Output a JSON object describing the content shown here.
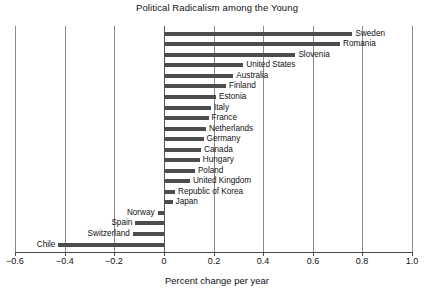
{
  "chart_data": {
    "type": "bar",
    "orientation": "horizontal",
    "title": "Political Radicalism among the Young",
    "xlabel": "Percent change per year",
    "ylabel": "",
    "xlim": [
      -0.6,
      1.0
    ],
    "xticks": [
      -0.6,
      -0.4,
      -0.2,
      0,
      0.2,
      0.4,
      0.6,
      0.8,
      1.0
    ],
    "xticklabels": [
      "−0.6",
      "−0.4",
      "−0.2",
      "0",
      "0.2",
      "0.4",
      "0.6",
      "0.8",
      "1.0"
    ],
    "grid": true,
    "grid_axis": "x",
    "legend": false,
    "bar_color": "#4d4d4d",
    "categories": [
      "Sweden",
      "Romania",
      "Slovenia",
      "United States",
      "Australia",
      "Finland",
      "Estonia",
      "Italy",
      "France",
      "Netherlands",
      "Germany",
      "Canada",
      "Hungary",
      "Poland",
      "United Kingdom",
      "Republic of Korea",
      "Japan",
      "Norway",
      "Spain",
      "Switzerland",
      "Chile"
    ],
    "values": [
      0.76,
      0.71,
      0.53,
      0.32,
      0.28,
      0.25,
      0.21,
      0.19,
      0.18,
      0.17,
      0.16,
      0.15,
      0.145,
      0.125,
      0.105,
      0.045,
      0.035,
      -0.025,
      -0.115,
      -0.125,
      -0.425
    ]
  }
}
